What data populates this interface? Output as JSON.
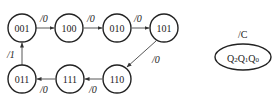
{
  "diagram": {
    "type": "state-diagram",
    "states": [
      {
        "id": "s001",
        "label": "001",
        "cx": 22,
        "cy": 28
      },
      {
        "id": "s100",
        "label": "100",
        "cx": 69,
        "cy": 28
      },
      {
        "id": "s010",
        "label": "010",
        "cx": 117,
        "cy": 28
      },
      {
        "id": "s101",
        "label": "101",
        "cx": 164,
        "cy": 28
      },
      {
        "id": "s110",
        "label": "110",
        "cx": 117,
        "cy": 79
      },
      {
        "id": "s111",
        "label": "111",
        "cx": 70,
        "cy": 79
      },
      {
        "id": "s011",
        "label": "011",
        "cx": 22,
        "cy": 79
      }
    ],
    "transitions": [
      {
        "from": "001",
        "to": "100",
        "label": "/0"
      },
      {
        "from": "100",
        "to": "010",
        "label": "/0"
      },
      {
        "from": "010",
        "to": "101",
        "label": "/0"
      },
      {
        "from": "101",
        "to": "110",
        "label": "/0"
      },
      {
        "from": "110",
        "to": "111",
        "label": "/0"
      },
      {
        "from": "111",
        "to": "011",
        "label": "/0"
      },
      {
        "from": "011",
        "to": "001",
        "label": "/1"
      }
    ],
    "legend": {
      "output_label": "/C",
      "state_label": "Q2Q1Q0"
    }
  }
}
